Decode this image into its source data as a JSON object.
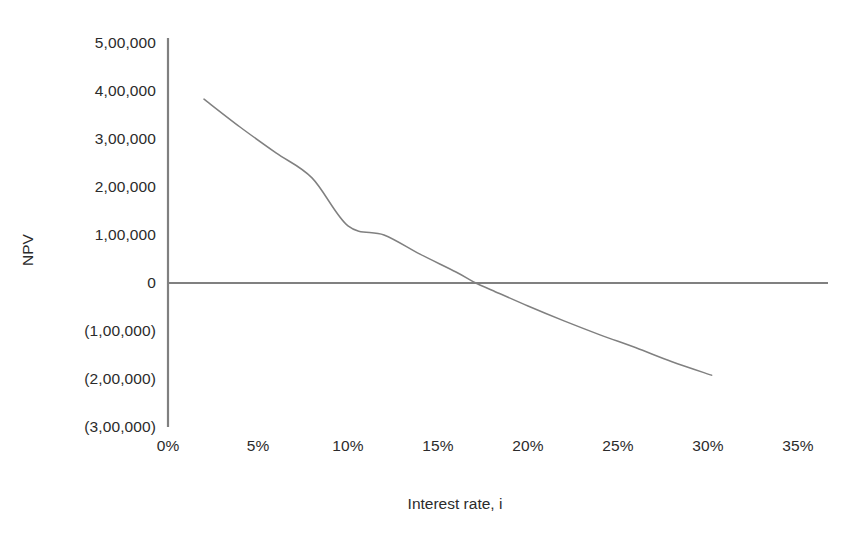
{
  "chart_data": {
    "type": "line",
    "title": "",
    "subtitle": "",
    "xlabel": "Interest rate, i",
    "ylabel": "NPV",
    "xlim": [
      0,
      35
    ],
    "ylim": [
      -300000,
      500000
    ],
    "grid": false,
    "legend": "none",
    "x_tick_labels": [
      "0%",
      "5%",
      "10%",
      "15%",
      "20%",
      "25%",
      "30%",
      "35%"
    ],
    "x_tick_values": [
      0,
      5,
      10,
      15,
      20,
      25,
      30,
      35
    ],
    "y_tick_labels": [
      "5,00,000",
      "4,00,000",
      "3,00,000",
      "2,00,000",
      "1,00,000",
      "0",
      "(1,00,000)",
      "(2,00,000)",
      "(3,00,000)"
    ],
    "y_tick_values": [
      500000,
      400000,
      300000,
      200000,
      100000,
      0,
      -100000,
      -200000,
      -300000
    ],
    "series": [
      {
        "name": "NPV curve",
        "color": "#808080",
        "x": [
          2,
          4,
          6,
          8,
          10,
          12,
          14,
          16,
          17.1,
          18,
          20,
          22,
          24,
          26,
          28,
          30.2
        ],
        "values": [
          383000,
          325000,
          271000,
          219000,
          119000,
          100000,
          60000,
          23000,
          0,
          -15000,
          -48000,
          -79000,
          -108000,
          -135000,
          -164000,
          -192000
        ]
      }
    ],
    "annotations": [
      {
        "name": "zero-axis-line",
        "y": 0,
        "x_from": 0,
        "x_to": 36.7,
        "color": "#808080"
      }
    ]
  },
  "axis": {
    "y_axis_color": "#808080",
    "zero_line_color": "#808080"
  }
}
